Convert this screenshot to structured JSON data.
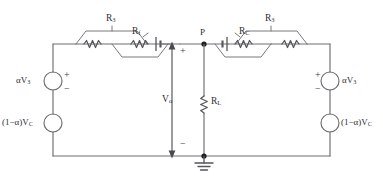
{
  "figure": {
    "name": "push-pull-bridge-circuit",
    "width": 383,
    "height": 183,
    "background": "#ffffff",
    "wire_color": "#6e6e72",
    "text_color": "#2e2e33"
  },
  "nodes": {
    "p_label": "P",
    "ground_label": ""
  },
  "output": {
    "label_html": "V<sub>o</sub>",
    "plus": "+",
    "minus": "−"
  },
  "load": {
    "label_html": "R<sub>L</sub>"
  },
  "left_branch": {
    "upper_resistor_html": "R<sub>3</sub>",
    "lower_resistor_html": "R<sub>f</sub>"
  },
  "right_branch": {
    "upper_resistor_html": "R<sub>3</sub>",
    "lower_resistor_html": "R<sub>C</sub>"
  },
  "left_sources": [
    {
      "label_html": "αV<sub>3</sub>",
      "plus": "+",
      "minus": "−",
      "type": "voltage-source"
    },
    {
      "label_html": "(1−α)V<sub>C</sub>",
      "plus": "",
      "minus": "",
      "type": "voltage-source"
    }
  ],
  "right_sources": [
    {
      "label_html": "αV<sub>3</sub>",
      "plus": "+",
      "minus": "−",
      "type": "voltage-source"
    },
    {
      "label_html": "(1−α)V<sub>C</sub>",
      "plus": "",
      "minus": "",
      "type": "voltage-source"
    }
  ]
}
